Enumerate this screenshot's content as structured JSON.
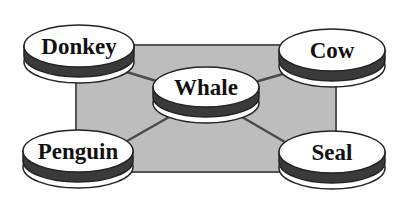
{
  "diagram": {
    "type": "network",
    "background_color": "#ffffff",
    "panel": {
      "x": 76,
      "y": 45,
      "w": 260,
      "h": 127,
      "fill": "#bdbdbd",
      "stroke": "#555555"
    },
    "colors": {
      "disc_top": "#ffffff",
      "disc_band": "#3a3a3a",
      "disc_base": "#ffffff",
      "edge": "#4a4a4a"
    },
    "nodes": [
      {
        "id": "donkey",
        "label": "Donkey",
        "cx": 79,
        "cy": 46
      },
      {
        "id": "cow",
        "label": "Cow",
        "cx": 332,
        "cy": 50
      },
      {
        "id": "whale",
        "label": "Whale",
        "cx": 206,
        "cy": 87
      },
      {
        "id": "penguin",
        "label": "Penguin",
        "cx": 78,
        "cy": 151
      },
      {
        "id": "seal",
        "label": "Seal",
        "cx": 332,
        "cy": 152
      }
    ],
    "edges": [
      {
        "from": "whale",
        "to": "donkey"
      },
      {
        "from": "whale",
        "to": "cow"
      },
      {
        "from": "whale",
        "to": "penguin"
      },
      {
        "from": "whale",
        "to": "seal"
      }
    ]
  }
}
